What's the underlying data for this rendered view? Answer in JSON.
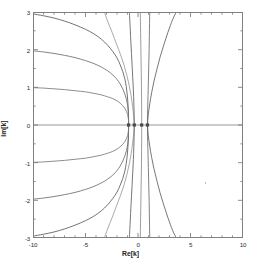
{
  "figure": {
    "xlabel": "Re[k]",
    "ylabel": "Im[k]"
  },
  "chart_data": {
    "type": "line",
    "title": "",
    "xlabel": "Re[k]",
    "ylabel": "Im[k]",
    "xlim": [
      -10,
      10
    ],
    "ylim": [
      -3,
      3
    ],
    "grid": false,
    "legend": null,
    "x_major_ticks": [
      -10,
      -5,
      0,
      5,
      10
    ],
    "x_major_tick_labels": [
      "-10",
      "-5",
      "0",
      "5",
      "10"
    ],
    "x_minor_tick_step": 1,
    "y_major_ticks": [
      -3,
      -2,
      -1,
      0,
      1,
      2,
      3
    ],
    "y_major_tick_labels": [
      "-3",
      "-2",
      "-1",
      "0",
      "1",
      "2",
      "3"
    ],
    "y_minor_tick_step": 0.5,
    "frame": "box-with-inward-ticks",
    "real_axis_line": {
      "y": 0,
      "x_from": -10,
      "x_to": 10,
      "color": "#8c8c8c"
    },
    "convergence_points": [
      -0.9,
      -0.35,
      0.35,
      0.9
    ],
    "series": [
      {
        "name": "branch-upper-1",
        "color": "#5a5a5a",
        "points": [
          [
            -10,
            2.95
          ],
          [
            -9,
            2.9
          ],
          [
            -8,
            2.84
          ],
          [
            -7,
            2.76
          ],
          [
            -6,
            2.66
          ],
          [
            -5,
            2.54
          ],
          [
            -4.2,
            2.42
          ],
          [
            -3.5,
            2.28
          ],
          [
            -2.9,
            2.12
          ],
          [
            -2.4,
            1.95
          ],
          [
            -2.0,
            1.78
          ],
          [
            -1.7,
            1.6
          ],
          [
            -1.45,
            1.42
          ],
          [
            -1.25,
            1.22
          ],
          [
            -1.12,
            1.02
          ],
          [
            -1.02,
            0.8
          ],
          [
            -0.96,
            0.58
          ],
          [
            -0.92,
            0.34
          ],
          [
            -0.9,
            0.12
          ],
          [
            -0.9,
            0.0
          ]
        ]
      },
      {
        "name": "branch-lower-1",
        "color": "#5a5a5a",
        "points": [
          [
            -10,
            -2.95
          ],
          [
            -9,
            -2.9
          ],
          [
            -8,
            -2.84
          ],
          [
            -7,
            -2.76
          ],
          [
            -6,
            -2.66
          ],
          [
            -5,
            -2.54
          ],
          [
            -4.2,
            -2.42
          ],
          [
            -3.5,
            -2.28
          ],
          [
            -2.9,
            -2.12
          ],
          [
            -2.4,
            -1.95
          ],
          [
            -2.0,
            -1.78
          ],
          [
            -1.7,
            -1.6
          ],
          [
            -1.45,
            -1.42
          ],
          [
            -1.25,
            -1.22
          ],
          [
            -1.12,
            -1.02
          ],
          [
            -1.02,
            -0.8
          ],
          [
            -0.96,
            -0.58
          ],
          [
            -0.92,
            -0.34
          ],
          [
            -0.9,
            -0.12
          ],
          [
            -0.9,
            0.0
          ]
        ]
      },
      {
        "name": "branch-upper-2",
        "color": "#6e6e6e",
        "points": [
          [
            -10,
            1.97
          ],
          [
            -9,
            1.94
          ],
          [
            -8,
            1.9
          ],
          [
            -7,
            1.85
          ],
          [
            -6,
            1.79
          ],
          [
            -5,
            1.71
          ],
          [
            -4.2,
            1.63
          ],
          [
            -3.5,
            1.54
          ],
          [
            -2.9,
            1.44
          ],
          [
            -2.4,
            1.33
          ],
          [
            -2.0,
            1.21
          ],
          [
            -1.7,
            1.09
          ],
          [
            -1.45,
            0.96
          ],
          [
            -1.25,
            0.82
          ],
          [
            -1.1,
            0.68
          ],
          [
            -0.99,
            0.53
          ],
          [
            -0.92,
            0.37
          ],
          [
            -0.9,
            0.2
          ],
          [
            -0.9,
            0.05
          ],
          [
            -0.9,
            0.0
          ]
        ]
      },
      {
        "name": "branch-lower-2",
        "color": "#6e6e6e",
        "points": [
          [
            -10,
            -1.97
          ],
          [
            -9,
            -1.94
          ],
          [
            -8,
            -1.9
          ],
          [
            -7,
            -1.85
          ],
          [
            -6,
            -1.79
          ],
          [
            -5,
            -1.71
          ],
          [
            -4.2,
            -1.63
          ],
          [
            -3.5,
            -1.54
          ],
          [
            -2.9,
            -1.44
          ],
          [
            -2.4,
            -1.33
          ],
          [
            -2.0,
            -1.21
          ],
          [
            -1.7,
            -1.09
          ],
          [
            -1.45,
            -0.96
          ],
          [
            -1.25,
            -0.82
          ],
          [
            -1.1,
            -0.68
          ],
          [
            -0.99,
            -0.53
          ],
          [
            -0.92,
            -0.37
          ],
          [
            -0.9,
            -0.2
          ],
          [
            -0.9,
            -0.05
          ],
          [
            -0.9,
            0.0
          ]
        ]
      },
      {
        "name": "branch-upper-3",
        "color": "#7a7a7a",
        "points": [
          [
            -10,
            0.99
          ],
          [
            -9,
            0.98
          ],
          [
            -8,
            0.96
          ],
          [
            -7,
            0.94
          ],
          [
            -6,
            0.91
          ],
          [
            -5,
            0.88
          ],
          [
            -4.2,
            0.84
          ],
          [
            -3.5,
            0.8
          ],
          [
            -2.9,
            0.75
          ],
          [
            -2.4,
            0.7
          ],
          [
            -2.0,
            0.64
          ],
          [
            -1.7,
            0.58
          ],
          [
            -1.45,
            0.51
          ],
          [
            -1.25,
            0.44
          ],
          [
            -1.1,
            0.36
          ],
          [
            -0.99,
            0.28
          ],
          [
            -0.93,
            0.19
          ],
          [
            -0.9,
            0.1
          ],
          [
            -0.9,
            0.03
          ],
          [
            -0.9,
            0.0
          ]
        ]
      },
      {
        "name": "branch-lower-3",
        "color": "#7a7a7a",
        "points": [
          [
            -10,
            -0.99
          ],
          [
            -9,
            -0.98
          ],
          [
            -8,
            -0.96
          ],
          [
            -7,
            -0.94
          ],
          [
            -6,
            -0.91
          ],
          [
            -5,
            -0.88
          ],
          [
            -4.2,
            -0.84
          ],
          [
            -3.5,
            -0.8
          ],
          [
            -2.9,
            -0.75
          ],
          [
            -2.4,
            -0.7
          ],
          [
            -2.0,
            -0.64
          ],
          [
            -1.7,
            -0.58
          ],
          [
            -1.45,
            -0.51
          ],
          [
            -1.25,
            -0.44
          ],
          [
            -1.1,
            -0.36
          ],
          [
            -0.99,
            -0.28
          ],
          [
            -0.93,
            -0.19
          ],
          [
            -0.9,
            -0.1
          ],
          [
            -0.9,
            -0.03
          ],
          [
            -0.9,
            0.0
          ]
        ]
      },
      {
        "name": "steep-upper-left-outer",
        "color": "#9a9a9a",
        "points": [
          [
            -0.35,
            0.0
          ],
          [
            -0.42,
            0.25
          ],
          [
            -0.52,
            0.5
          ],
          [
            -0.66,
            0.78
          ],
          [
            -0.84,
            1.05
          ],
          [
            -1.06,
            1.32
          ],
          [
            -1.34,
            1.6
          ],
          [
            -1.68,
            1.88
          ],
          [
            -2.05,
            2.15
          ],
          [
            -2.45,
            2.45
          ],
          [
            -2.9,
            2.76
          ],
          [
            -3.2,
            3.0
          ]
        ]
      },
      {
        "name": "steep-lower-left-outer",
        "color": "#9a9a9a",
        "points": [
          [
            -0.35,
            0.0
          ],
          [
            -0.42,
            -0.25
          ],
          [
            -0.52,
            -0.5
          ],
          [
            -0.66,
            -0.78
          ],
          [
            -0.84,
            -1.05
          ],
          [
            -1.06,
            -1.32
          ],
          [
            -1.34,
            -1.6
          ],
          [
            -1.68,
            -1.88
          ],
          [
            -2.05,
            -2.15
          ],
          [
            -2.45,
            -2.45
          ],
          [
            -2.9,
            -2.76
          ],
          [
            -3.2,
            -3.0
          ]
        ]
      },
      {
        "name": "steep-upper-left-inner",
        "color": "#5e5e5e",
        "points": [
          [
            -0.35,
            0.0
          ],
          [
            -0.37,
            0.3
          ],
          [
            -0.4,
            0.6
          ],
          [
            -0.44,
            0.92
          ],
          [
            -0.5,
            1.25
          ],
          [
            -0.56,
            1.58
          ],
          [
            -0.62,
            1.9
          ],
          [
            -0.68,
            2.2
          ],
          [
            -0.73,
            2.5
          ],
          [
            -0.78,
            2.78
          ],
          [
            -0.82,
            3.0
          ]
        ]
      },
      {
        "name": "steep-lower-left-inner",
        "color": "#5e5e5e",
        "points": [
          [
            -0.35,
            0.0
          ],
          [
            -0.37,
            -0.3
          ],
          [
            -0.4,
            -0.6
          ],
          [
            -0.44,
            -0.92
          ],
          [
            -0.5,
            -1.25
          ],
          [
            -0.56,
            -1.58
          ],
          [
            -0.62,
            -1.9
          ],
          [
            -0.68,
            -2.2
          ],
          [
            -0.73,
            -2.5
          ],
          [
            -0.78,
            -2.78
          ],
          [
            -0.82,
            -3.0
          ]
        ]
      },
      {
        "name": "steep-upper-center",
        "color": "#8a8a8a",
        "points": [
          [
            0.35,
            0.0
          ],
          [
            0.35,
            0.35
          ],
          [
            0.34,
            0.7
          ],
          [
            0.33,
            1.05
          ],
          [
            0.31,
            1.4
          ],
          [
            0.29,
            1.75
          ],
          [
            0.27,
            2.1
          ],
          [
            0.25,
            2.45
          ],
          [
            0.23,
            2.75
          ],
          [
            0.22,
            3.0
          ]
        ]
      },
      {
        "name": "steep-lower-center",
        "color": "#8a8a8a",
        "points": [
          [
            0.35,
            0.0
          ],
          [
            0.35,
            -0.35
          ],
          [
            0.34,
            -0.7
          ],
          [
            0.33,
            -1.05
          ],
          [
            0.31,
            -1.4
          ],
          [
            0.29,
            -1.75
          ],
          [
            0.27,
            -2.1
          ],
          [
            0.25,
            -2.45
          ],
          [
            0.23,
            -2.75
          ],
          [
            0.22,
            -3.0
          ]
        ]
      },
      {
        "name": "steep-upper-right-inner",
        "color": "#6a6a6a",
        "points": [
          [
            0.9,
            0.0
          ],
          [
            0.91,
            0.3
          ],
          [
            0.94,
            0.62
          ],
          [
            0.97,
            0.95
          ],
          [
            1.0,
            1.3
          ],
          [
            1.03,
            1.65
          ],
          [
            1.06,
            2.0
          ],
          [
            1.08,
            2.35
          ],
          [
            1.1,
            2.7
          ],
          [
            1.12,
            3.0
          ]
        ]
      },
      {
        "name": "steep-lower-right-inner",
        "color": "#6a6a6a",
        "points": [
          [
            0.9,
            0.0
          ],
          [
            0.91,
            -0.3
          ],
          [
            0.94,
            -0.62
          ],
          [
            0.97,
            -0.95
          ],
          [
            1.0,
            -1.3
          ],
          [
            1.03,
            -1.65
          ],
          [
            1.06,
            -2.0
          ],
          [
            1.08,
            -2.35
          ],
          [
            1.1,
            -2.7
          ],
          [
            1.12,
            -3.0
          ]
        ]
      },
      {
        "name": "steep-upper-right-outer",
        "color": "#5e5e5e",
        "points": [
          [
            0.9,
            0.0
          ],
          [
            0.98,
            0.28
          ],
          [
            1.12,
            0.56
          ],
          [
            1.3,
            0.86
          ],
          [
            1.52,
            1.16
          ],
          [
            1.8,
            1.48
          ],
          [
            2.1,
            1.8
          ],
          [
            2.45,
            2.12
          ],
          [
            2.85,
            2.46
          ],
          [
            3.3,
            2.8
          ],
          [
            3.65,
            3.0
          ]
        ]
      },
      {
        "name": "steep-lower-right-outer",
        "color": "#5e5e5e",
        "points": [
          [
            0.9,
            0.0
          ],
          [
            0.98,
            -0.28
          ],
          [
            1.12,
            -0.56
          ],
          [
            1.3,
            -0.86
          ],
          [
            1.52,
            -1.16
          ],
          [
            1.8,
            -1.48
          ],
          [
            2.1,
            -1.8
          ],
          [
            2.45,
            -2.12
          ],
          [
            2.85,
            -2.46
          ],
          [
            3.3,
            -2.8
          ],
          [
            3.65,
            -3.0
          ]
        ]
      }
    ]
  }
}
